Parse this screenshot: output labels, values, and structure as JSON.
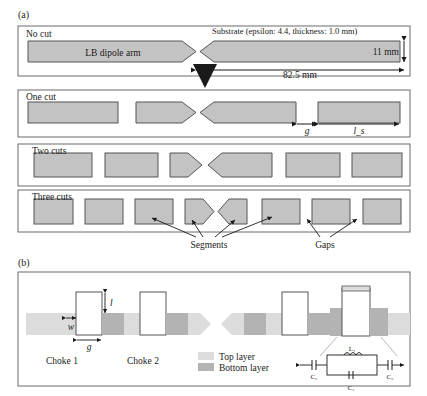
{
  "figure": {
    "panel_a_label": "(a)",
    "panel_b_label": "(b)"
  },
  "panel_a": {
    "rows": [
      {
        "name": "no-cut",
        "label": "No cut",
        "segments": 2
      },
      {
        "name": "one-cut",
        "label": "One cut",
        "segments": 4
      },
      {
        "name": "two-cuts",
        "label": "Two cuts",
        "segments": 6
      },
      {
        "name": "three-cuts",
        "label": "Three cuts",
        "segments": 8
      }
    ],
    "arm_label": "LB dipole arm",
    "substrate_note": "Substrate (epsilon: 4.4, thickness: 1.0 mm)",
    "width_label": "11 mm",
    "length_label": "82.5 mm",
    "gap_symbol": "g",
    "segment_len_symbol": "l_s",
    "callout_segments": "Segments",
    "callout_gaps": "Gaps"
  },
  "panel_b": {
    "choke1_label": "Choke 1",
    "choke2_label": "Choke 2",
    "dim_l": "l",
    "dim_w": "w",
    "dim_g": "g",
    "legend": [
      {
        "name": "top-layer",
        "label": "Top layer",
        "color": "#dcdcdc"
      },
      {
        "name": "bottom-layer",
        "label": "Bottom layer",
        "color": "#b3b3b3"
      }
    ],
    "circuit": {
      "inductor_label": "L₁",
      "cap_series_label": "C₁",
      "cap_shunt_label_left": "C₂",
      "cap_shunt_label_right": "C₂"
    }
  },
  "colors": {
    "metal_fill": "#c3c3c3",
    "metal_stroke": "#555555",
    "top_layer": "#dcdcdc",
    "bottom_layer": "#b3b3b3",
    "outline": "#6b6b6b",
    "ink": "#1a1a1a"
  }
}
